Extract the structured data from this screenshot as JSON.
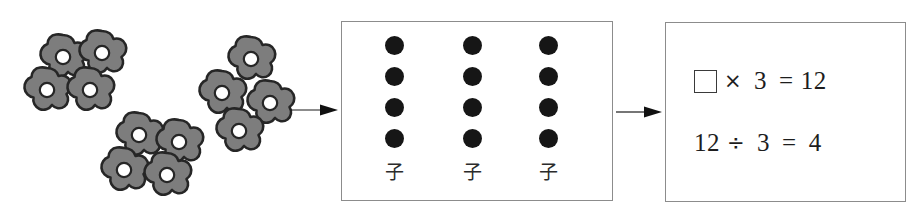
{
  "diagram": {
    "total_items": 12,
    "group_count": 3,
    "items_per_group": 4
  },
  "flower_field": {
    "icon": "flower-icon",
    "fill_color": "#7d7d7d",
    "outline_color": "#262626",
    "center_color": "#ffffff",
    "clusters": [
      {
        "name": "cluster-top-left",
        "count": 4,
        "flowers": [
          {
            "x": 36,
            "y": 32
          },
          {
            "x": 75,
            "y": 28
          },
          {
            "x": 20,
            "y": 65
          },
          {
            "x": 63,
            "y": 65
          }
        ]
      },
      {
        "name": "cluster-bottom-middle",
        "count": 4,
        "flowers": [
          {
            "x": 112,
            "y": 110
          },
          {
            "x": 152,
            "y": 117
          },
          {
            "x": 97,
            "y": 145
          },
          {
            "x": 140,
            "y": 150
          }
        ]
      },
      {
        "name": "cluster-right",
        "count": 4,
        "flowers": [
          {
            "x": 224,
            "y": 34
          },
          {
            "x": 195,
            "y": 68
          },
          {
            "x": 243,
            "y": 78
          },
          {
            "x": 212,
            "y": 106
          }
        ]
      }
    ]
  },
  "arrows": [
    {
      "name": "arrow-flowers-to-dots",
      "x": 290,
      "y": 103,
      "width": 48
    },
    {
      "name": "arrow-dots-to-equations",
      "x": 616,
      "y": 105,
      "width": 46
    }
  ],
  "dot_panel": {
    "columns": [
      {
        "label": "子",
        "dot_count": 4
      },
      {
        "label": "子",
        "dot_count": 4
      },
      {
        "label": "子",
        "dot_count": 4
      }
    ],
    "column_positions": [
      30,
      108,
      184
    ],
    "dot_color": "#161616",
    "border_color": "#8c8c8c"
  },
  "equation_panel": {
    "border_color": "#8c8c8c",
    "equations": [
      {
        "name": "multiplication-equation",
        "has_blank_box": true,
        "blank_label": "",
        "operator": "×",
        "operand": "3",
        "equals": "=",
        "result": "12",
        "full_text": "□ × 3 = 12"
      },
      {
        "name": "division-equation",
        "has_blank_box": false,
        "dividend": "12",
        "operator": "÷",
        "operand": "3",
        "equals": "=",
        "result": "4",
        "full_text": "12 ÷ 3 = 4"
      }
    ]
  }
}
